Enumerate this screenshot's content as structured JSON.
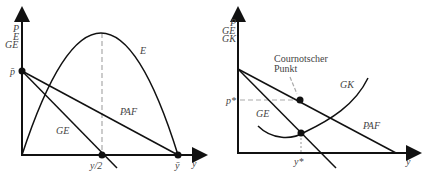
{
  "left_diagram": {
    "y_axis_labels": [
      "P",
      "E",
      "GE"
    ],
    "x_axis_label": "y",
    "curves": {
      "E": "E",
      "GE": "GE",
      "PAF": "PAF"
    },
    "points": {
      "p_bar": "p̄",
      "y_half": "y/2",
      "y_bar": "ȳ"
    }
  },
  "right_diagram": {
    "y_axis_labels": [
      "P",
      "GE",
      "GK"
    ],
    "x_axis_label": "y",
    "curves": {
      "GK": "GK",
      "GE": "GE",
      "PAF": "PAF"
    },
    "points": {
      "p_star": "p*",
      "y_star": "y*"
    },
    "annotation": {
      "line1": "Cournotscher",
      "line2": "Punkt"
    }
  },
  "colors": {
    "line": "#111111",
    "dashed": "#aaaaaa",
    "text": "#444444"
  }
}
